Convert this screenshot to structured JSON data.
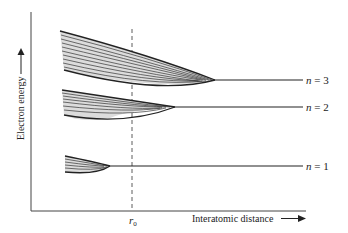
{
  "diagram": {
    "type": "energy-band-diagram",
    "axes": {
      "y_label": "Electron energy",
      "x_label": "Interatomic distance",
      "x_marker": "r",
      "x_marker_subscript": "0"
    },
    "levels": [
      {
        "id": "n3",
        "label": "n = 3",
        "n_var": "n",
        "n_value": "3"
      },
      {
        "id": "n2",
        "label": "n = 2",
        "n_var": "n",
        "n_value": "2"
      },
      {
        "id": "n1",
        "label": "n = 1",
        "n_var": "n",
        "n_value": "1"
      }
    ],
    "colors": {
      "line": "#222222",
      "band_fill": "#d9d9d9",
      "axis": "#444444"
    }
  }
}
